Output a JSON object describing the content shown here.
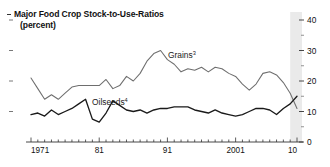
{
  "chart": {
    "title_line1": "Major Food Crop Stock-to-Use-Ratios",
    "title_line2": "(percent)",
    "bullet": "title-bullet-dash"
  },
  "axes": {
    "y_ticks": [
      "0",
      "10",
      "20",
      "30",
      "40"
    ],
    "y_minor_ticks": [
      "5",
      "15",
      "25",
      "35"
    ],
    "x_ticks": [
      "1971",
      "81",
      "91",
      "2001",
      "10"
    ]
  },
  "series_labels": {
    "grains": "Grains",
    "grains_sup": "3",
    "oilseeds": "Oilseeds",
    "oilseeds_sup": "4"
  },
  "colors": {
    "grains": "#6e6e6e",
    "oilseeds": "#1a1a1a",
    "axis": "#333333",
    "shade": "#e6e6e6"
  },
  "chart_data": {
    "type": "line",
    "title": "Major Food Crop Stock-to-Use-Ratios (percent)",
    "xlabel": "",
    "ylabel": "percent",
    "ylim": [
      0,
      40
    ],
    "xlim": [
      1971,
      2010
    ],
    "y_axis_side": "right",
    "grid": false,
    "legend": "inline-labels",
    "annotations": [
      {
        "text": "Grains3",
        "x": 1993,
        "y": 27
      },
      {
        "text": "Oilseeds4",
        "x": 1987,
        "y": 15
      }
    ],
    "shaded_band": {
      "from": 2009,
      "to": 2010,
      "color": "#e6e6e6",
      "note": "projection"
    },
    "x": [
      1971,
      1972,
      1973,
      1974,
      1975,
      1976,
      1977,
      1978,
      1979,
      1980,
      1981,
      1982,
      1983,
      1984,
      1985,
      1986,
      1987,
      1988,
      1989,
      1990,
      1991,
      1992,
      1993,
      1994,
      1995,
      1996,
      1997,
      1998,
      1999,
      2000,
      2001,
      2002,
      2003,
      2004,
      2005,
      2006,
      2007,
      2008,
      2009,
      2010
    ],
    "series": [
      {
        "name": "Grains",
        "color": "#6e6e6e",
        "values": [
          21.0,
          17.5,
          14.0,
          15.5,
          14.0,
          16.0,
          18.0,
          18.5,
          18.5,
          18.5,
          18.5,
          20.5,
          17.5,
          18.5,
          21.5,
          20.0,
          22.5,
          26.5,
          29.0,
          30.0,
          27.0,
          25.5,
          23.0,
          24.0,
          23.5,
          24.5,
          23.0,
          24.5,
          24.0,
          22.5,
          21.5,
          19.0,
          17.0,
          19.0,
          22.5,
          23.0,
          22.0,
          19.5,
          16.0,
          11.0
        ]
      },
      {
        "name": "Oilseeds",
        "color": "#1a1a1a",
        "values": [
          9.0,
          9.5,
          8.5,
          10.5,
          9.0,
          10.0,
          11.0,
          12.5,
          14.0,
          7.5,
          6.5,
          9.5,
          13.5,
          12.0,
          10.5,
          10.0,
          10.5,
          9.5,
          10.5,
          11.0,
          11.0,
          11.5,
          11.5,
          11.5,
          10.5,
          10.0,
          9.5,
          10.5,
          9.5,
          9.0,
          8.5,
          9.0,
          10.0,
          11.0,
          11.0,
          10.5,
          9.0,
          11.0,
          12.5,
          15.0
        ]
      }
    ]
  }
}
